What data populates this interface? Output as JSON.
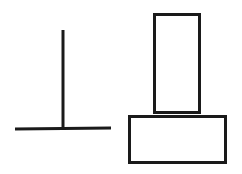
{
  "diagram": {
    "stroke_color": "#1a1a1a",
    "background": "#ffffff",
    "figures": [
      {
        "name": "inverted-t-shape",
        "parts": [
          "vertical-line",
          "horizontal-base-line"
        ]
      },
      {
        "name": "stacked-rectangles",
        "parts": [
          "tall-rectangle",
          "wide-rectangle"
        ]
      }
    ]
  }
}
